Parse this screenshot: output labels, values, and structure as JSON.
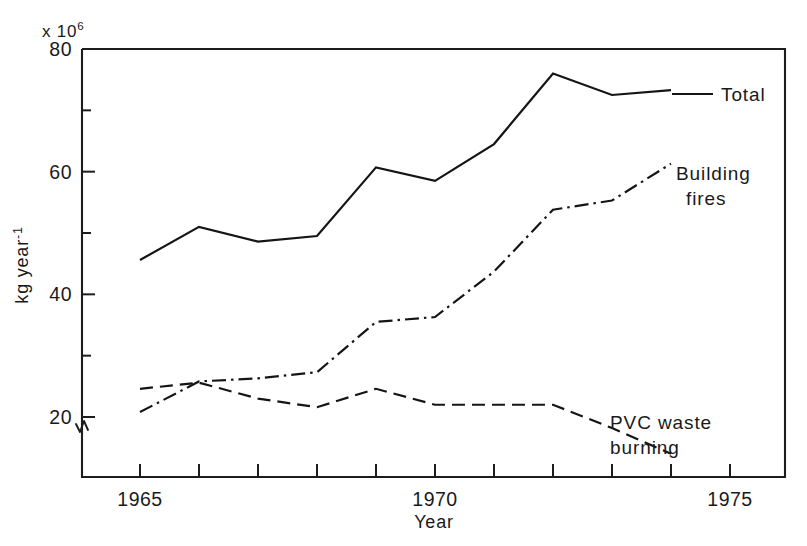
{
  "chart_data": {
    "type": "line",
    "title": "",
    "xlabel": "Year",
    "ylabel": "kg year",
    "ylabel_superscript": "-1",
    "y_multiplier_label": "x 10",
    "y_multiplier_exponent": "6",
    "x": [
      1965,
      1966,
      1967,
      1968,
      1969,
      1970,
      1971,
      1972,
      1973,
      1974
    ],
    "xlim": [
      1964,
      1975.9
    ],
    "ylim": [
      14,
      80
    ],
    "xticks": [
      1965,
      1966,
      1967,
      1968,
      1969,
      1970,
      1971,
      1972,
      1973,
      1974,
      1975
    ],
    "xtick_labels": [
      "1965",
      "",
      "",
      "",
      "",
      "1970",
      "",
      "",
      "",
      "",
      "1975"
    ],
    "yticks": [
      20,
      30,
      40,
      50,
      60,
      70,
      80
    ],
    "ytick_labels": [
      "20",
      "",
      "40",
      "",
      "60",
      "",
      "80"
    ],
    "grid": false,
    "legend_position": "inline-right",
    "axis_break": true,
    "series": [
      {
        "name": "Total",
        "label": "Total",
        "style": "solid",
        "x": [
          1965,
          1966,
          1967,
          1968,
          1969,
          1970,
          1971,
          1972,
          1973,
          1974
        ],
        "values": [
          45.6,
          51.0,
          48.6,
          49.5,
          60.7,
          58.5,
          64.5,
          76.0,
          72.5,
          73.3
        ],
        "label_pos": [
          1974.6,
          73.6
        ]
      },
      {
        "name": "Building fires",
        "label_line1": "Building",
        "label_line2": "fires",
        "style": "dash-dot",
        "x": [
          1965,
          1966,
          1967,
          1968,
          1969,
          1970,
          1971,
          1972,
          1973,
          1974
        ],
        "values": [
          20.8,
          25.8,
          26.3,
          27.3,
          35.5,
          36.3,
          43.7,
          53.8,
          55.3,
          61.3
        ],
        "label_pos": [
          1974.5,
          61.5
        ]
      },
      {
        "name": "PVC waste burning",
        "label_line1": "PVC waste",
        "label_line2": "burning",
        "style": "dashed",
        "x": [
          1965,
          1966,
          1967,
          1968,
          1969,
          1970,
          1971,
          1972,
          1973,
          1974
        ],
        "values": [
          24.6,
          25.6,
          23.0,
          21.6,
          24.6,
          22.0,
          22.0,
          22.0,
          18.2,
          14.0
        ],
        "label_pos": [
          1973.1,
          20.3
        ]
      }
    ]
  },
  "labels": {
    "y_axis_caption": "kg year",
    "y_axis_caption_sup": "-1",
    "x_axis_caption": "Year",
    "exponent_prefix": "x 10",
    "exponent_value": "6",
    "total": "Total",
    "building_1": "Building",
    "building_2": "fires",
    "pvc_1": "PVC waste",
    "pvc_2": "burning"
  },
  "colors": {
    "ink": "#1a1a1a",
    "background": "#ffffff"
  }
}
